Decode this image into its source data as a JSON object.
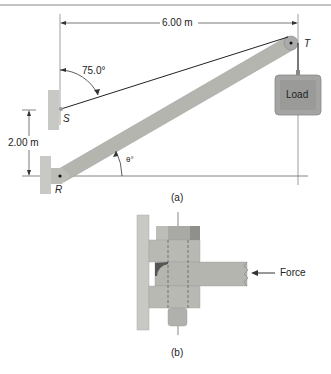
{
  "figure_a": {
    "caption": "(a)",
    "dimension_horizontal": "6.00 m",
    "dimension_vertical": "2.00 m",
    "cable_angle": "75.0°",
    "boom_angle": "θ°",
    "point_s": "S",
    "point_r": "R",
    "point_t": "T",
    "load_label": "Load"
  },
  "figure_b": {
    "caption": "(b)",
    "force_label": "Force"
  },
  "colors": {
    "boom": "#b5b5b0",
    "wall": "#c8c8c4",
    "load_box": "#9a9a98",
    "line": "#333333"
  }
}
